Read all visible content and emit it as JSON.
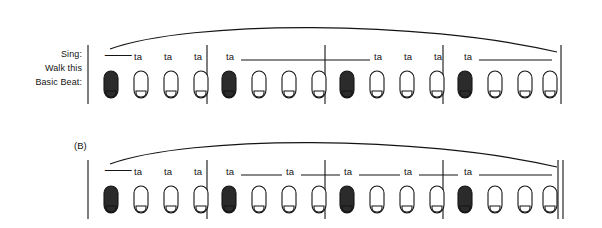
{
  "figure": {
    "type": "music-rhythm-notation-worksheet",
    "width": 602,
    "height": 228,
    "background": "#ffffff",
    "ink": "#141414"
  },
  "row_labels": {
    "line1": "Sing:",
    "line2": "Walk this",
    "line3": "Basic Beat:"
  },
  "symbols": {
    "rest_glyph": "⸺",
    "rest_name": "quarter-rest",
    "syllable": "ta"
  },
  "systems": [
    {
      "id": "system-a",
      "tag": "",
      "has_row_labels": true,
      "final_barline": "single",
      "measures": [
        {
          "index": 1,
          "beats": [
            {
              "kind": "rest",
              "label": "",
              "tie_px": 0
            },
            {
              "kind": "ta",
              "label": "ta",
              "tie_px": 0
            },
            {
              "kind": "ta",
              "label": "ta",
              "tie_px": 0
            },
            {
              "kind": "ta",
              "label": "ta",
              "tie_px": 0
            }
          ]
        },
        {
          "index": 2,
          "beats": [
            {
              "kind": "ta",
              "label": "ta",
              "tie_px": 121
            },
            {
              "kind": "hold",
              "label": "",
              "tie_px": 0
            },
            {
              "kind": "hold",
              "label": "",
              "tie_px": 0
            },
            {
              "kind": "hold",
              "label": "",
              "tie_px": 0
            }
          ]
        },
        {
          "index": 3,
          "beats": [
            {
              "kind": "hold",
              "label": "",
              "tie_px": 0
            },
            {
              "kind": "ta",
              "label": "ta",
              "tie_px": 0
            },
            {
              "kind": "ta",
              "label": "ta",
              "tie_px": 0
            },
            {
              "kind": "ta",
              "label": "ta",
              "tie_px": 0
            }
          ]
        },
        {
          "index": 4,
          "beats": [
            {
              "kind": "ta",
              "label": "ta",
              "tie_px": 92
            },
            {
              "kind": "hold",
              "label": "",
              "tie_px": 0
            },
            {
              "kind": "hold",
              "label": "",
              "tie_px": 0
            },
            {
              "kind": "hold",
              "label": "",
              "tie_px": 0
            }
          ]
        }
      ]
    },
    {
      "id": "system-b",
      "tag": "(B)",
      "has_row_labels": false,
      "final_barline": "double",
      "measures": [
        {
          "index": 1,
          "beats": [
            {
              "kind": "rest",
              "label": "",
              "tie_px": 0
            },
            {
              "kind": "ta",
              "label": "ta",
              "tie_px": 0
            },
            {
              "kind": "ta",
              "label": "ta",
              "tie_px": 0
            },
            {
              "kind": "ta",
              "label": "ta",
              "tie_px": 0
            }
          ]
        },
        {
          "index": 2,
          "beats": [
            {
              "kind": "ta",
              "label": "ta",
              "tie_px": 40
            },
            {
              "kind": "hold",
              "label": "",
              "tie_px": 0
            },
            {
              "kind": "ta",
              "label": "ta",
              "tie_px": 40
            },
            {
              "kind": "hold",
              "label": "",
              "tie_px": 0
            }
          ]
        },
        {
          "index": 3,
          "beats": [
            {
              "kind": "ta",
              "label": "ta",
              "tie_px": 40
            },
            {
              "kind": "hold",
              "label": "",
              "tie_px": 0
            },
            {
              "kind": "ta",
              "label": "ta",
              "tie_px": 40
            },
            {
              "kind": "hold",
              "label": "",
              "tie_px": 0
            }
          ]
        },
        {
          "index": 4,
          "beats": [
            {
              "kind": "ta",
              "label": "ta",
              "tie_px": 92
            },
            {
              "kind": "hold",
              "label": "",
              "tie_px": 0
            },
            {
              "kind": "hold",
              "label": "",
              "tie_px": 0
            },
            {
              "kind": "hold",
              "label": "",
              "tie_px": 0
            }
          ]
        }
      ]
    }
  ],
  "footprints": {
    "pattern_per_measure": [
      "filled",
      "outline",
      "outline",
      "outline"
    ],
    "icon_name": "footprint-icon"
  },
  "phrase_arcs": [
    {
      "system": "system-a",
      "name": "phrase-slur"
    },
    {
      "system": "system-b",
      "name": "phrase-slur"
    }
  ],
  "geometry": {
    "beat_x": [
      110,
      140,
      170,
      200,
      232,
      262,
      292,
      322,
      350,
      380,
      410,
      440,
      470,
      500,
      530,
      556
    ],
    "barline_x": [
      88,
      207,
      325,
      443,
      561
    ],
    "systemA": {
      "ta_y": 57,
      "foot_y": 80,
      "bar_top": 45,
      "bar_bottom": 104,
      "slur": "M110,49 C 200,22 420,22 557,52"
    },
    "systemB": {
      "ta_y": 172,
      "foot_y": 195,
      "bar_top": 160,
      "bar_bottom": 219,
      "slur": "M110,164 C 200,137 420,137 557,167"
    }
  }
}
